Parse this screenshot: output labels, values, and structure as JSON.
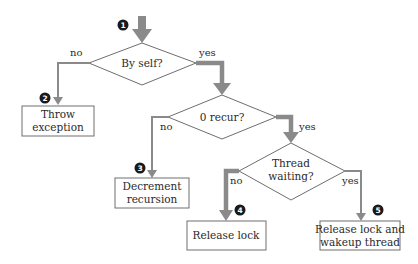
{
  "diagram": {
    "type": "flowchart",
    "colors": {
      "arrow": "#8a8a8a",
      "outline": "#6e6e6e",
      "text": "#2a2a2a",
      "marker": "#1a1a1a"
    },
    "start_marker": "1",
    "decisions": [
      {
        "id": "by-self",
        "label_lines": [
          "By self?"
        ]
      },
      {
        "id": "zero-recur",
        "label_lines": [
          "0 recur?"
        ]
      },
      {
        "id": "thread-waiting",
        "label_lines": [
          "Thread",
          "waiting?"
        ]
      }
    ],
    "actions": [
      {
        "id": "throw-exception",
        "marker": "2",
        "label_lines": [
          "Throw",
          "exception"
        ]
      },
      {
        "id": "decrement-recursion",
        "marker": "3",
        "label_lines": [
          "Decrement",
          "recursion"
        ]
      },
      {
        "id": "release-lock",
        "marker": "4",
        "label_lines": [
          "Release lock"
        ]
      },
      {
        "id": "release-wakeup",
        "marker": "5",
        "label_lines": [
          "Release lock and",
          "wakeup thread"
        ]
      }
    ],
    "edge_labels": {
      "by_self_no": "no",
      "by_self_yes": "yes",
      "zero_recur_no": "no",
      "zero_recur_yes": "yes",
      "thread_waiting_no": "no",
      "thread_waiting_yes": "yes"
    }
  }
}
